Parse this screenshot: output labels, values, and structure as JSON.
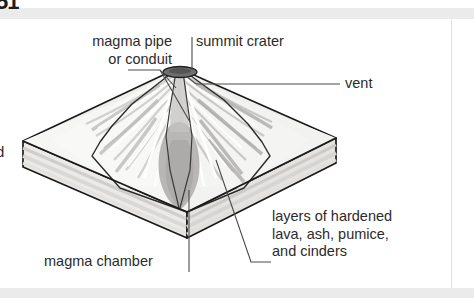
{
  "page": {
    "background_color": "#ffffff",
    "band_color": "#ebebeb",
    "clipped_top_text": "51",
    "clipped_left_text": "d"
  },
  "diagram": {
    "type": "labeled-illustration",
    "colors": {
      "outline": "#1a1a1a",
      "slab_top": "#efeeec",
      "slab_side": "#e6e5e3",
      "slab_layer": "#d8d7d4",
      "cone_light": "#f7f7f6",
      "cone_shadow": "#c9c8c6",
      "magma_chamber": "#b3b2b0",
      "crater": "#6e6e6e",
      "leader_line": "#3a3a3a",
      "text": "#2b2b2b"
    },
    "labels": [
      {
        "id": "magma-pipe",
        "lines": [
          "magma pipe",
          "or conduit"
        ],
        "text": "magma pipe\nor conduit",
        "position": "top-left"
      },
      {
        "id": "summit-crater",
        "lines": [
          "summit crater"
        ],
        "text": "summit crater",
        "position": "top-center"
      },
      {
        "id": "vent",
        "lines": [
          "vent"
        ],
        "text": "vent",
        "position": "right"
      },
      {
        "id": "layers",
        "lines": [
          "layers of hardened",
          "lava, ash, pumice,",
          "and cinders"
        ],
        "text": "layers of hardened\nlava, ash, pumice,\nand cinders",
        "position": "bottom-right"
      },
      {
        "id": "magma-chamber",
        "lines": [
          "magma chamber"
        ],
        "text": "magma chamber",
        "position": "bottom-left"
      }
    ]
  }
}
